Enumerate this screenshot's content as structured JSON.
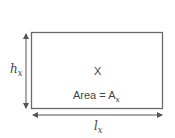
{
  "diagram": {
    "shape": "rectangle",
    "name_label": "X",
    "area_label": "Area = A",
    "area_subscript": "x",
    "height_label": "h",
    "height_subscript": "x",
    "length_label": "l",
    "length_subscript": "x",
    "colors": {
      "stroke": "#6b6b6b",
      "text": "#444444",
      "background": "#ffffff"
    }
  }
}
